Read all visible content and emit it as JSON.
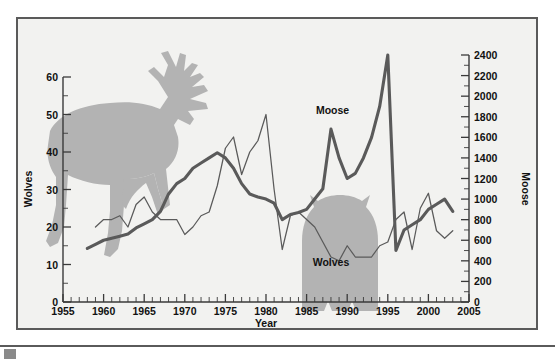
{
  "chart_data": {
    "type": "line",
    "title": "",
    "subtitle": "",
    "xlabel": "Year",
    "ylabel": "Wolves",
    "y2label": "Moose",
    "xlim": [
      1955,
      2005
    ],
    "ylim": [
      0,
      60
    ],
    "y2lim": [
      0,
      2400
    ],
    "grid": false,
    "legend_position": "inline-annotation",
    "x_ticks": [
      1955,
      1960,
      1965,
      1970,
      1975,
      1980,
      1985,
      1990,
      1995,
      2000,
      2005
    ],
    "x_tick_labels": [
      "1955",
      "1960",
      "1965",
      "1970",
      "1975",
      "1980",
      "1985",
      "1990",
      "1995",
      "2000",
      "2005"
    ],
    "x_minor_step": 1,
    "y_ticks": [
      0,
      10,
      20,
      30,
      40,
      50,
      60
    ],
    "y_tick_labels": [
      "0",
      "10",
      "20",
      "30",
      "40",
      "50",
      "60"
    ],
    "y_minor_step": 5,
    "y2_ticks": [
      0,
      200,
      400,
      600,
      800,
      1000,
      1200,
      1400,
      1600,
      1800,
      2000,
      2200,
      2400
    ],
    "y2_tick_labels": [
      "0",
      "200",
      "400",
      "600",
      "800",
      "1000",
      "1200",
      "1400",
      "1600",
      "1800",
      "2000",
      "2200",
      "2400"
    ],
    "y2_minor_step": 100,
    "annotations": [
      {
        "text": "Moose",
        "x": 1988.2,
        "y2": 1830
      },
      {
        "text": "Wolves",
        "x": 1988.0,
        "y": 9.6
      }
    ],
    "series": [
      {
        "name": "Moose",
        "axis": "right",
        "style": "thick-line",
        "color": "#5a5a5a",
        "x": [
          1958,
          1959,
          1960,
          1961,
          1962,
          1963,
          1964,
          1965,
          1966,
          1967,
          1968,
          1969,
          1970,
          1971,
          1972,
          1973,
          1974,
          1975,
          1976,
          1977,
          1978,
          1979,
          1980,
          1981,
          1982,
          1983,
          1984,
          1985,
          1986,
          1987,
          1988,
          1989,
          1990,
          1991,
          1992,
          1993,
          1994,
          1995,
          1996,
          1997,
          1998,
          1999,
          2000,
          2001,
          2002,
          2003
        ],
        "values": [
          520,
          560,
          600,
          620,
          640,
          660,
          720,
          760,
          800,
          880,
          1050,
          1150,
          1200,
          1300,
          1350,
          1400,
          1450,
          1400,
          1300,
          1150,
          1050,
          1020,
          1000,
          960,
          800,
          850,
          870,
          900,
          1000,
          1100,
          1680,
          1400,
          1200,
          1250,
          1400,
          1600,
          1900,
          2400,
          500,
          700,
          750,
          800,
          900,
          950,
          1000,
          880
        ]
      },
      {
        "name": "Wolves",
        "axis": "left",
        "style": "thin-line",
        "color": "#5a5a5a",
        "x": [
          1959,
          1960,
          1961,
          1962,
          1963,
          1964,
          1965,
          1966,
          1967,
          1968,
          1969,
          1970,
          1971,
          1972,
          1973,
          1974,
          1975,
          1976,
          1977,
          1978,
          1979,
          1980,
          1981,
          1982,
          1983,
          1984,
          1985,
          1986,
          1987,
          1988,
          1989,
          1990,
          1991,
          1992,
          1993,
          1994,
          1995,
          1996,
          1997,
          1998,
          1999,
          2000,
          2001,
          2002,
          2003
        ],
        "values": [
          20,
          22,
          22,
          23,
          20,
          26,
          28,
          24,
          22,
          22,
          22,
          18,
          20,
          23,
          24,
          31,
          41,
          44,
          34,
          40,
          43,
          50,
          30,
          14,
          23,
          24,
          22,
          20,
          16,
          12,
          11,
          15,
          12,
          12,
          12,
          15,
          16,
          22,
          24,
          14,
          25,
          29,
          19,
          17,
          19
        ]
      }
    ]
  },
  "axis": {
    "left_title": "Wolves",
    "right_title": "Moose",
    "bottom_title": "Year"
  },
  "labels": {
    "moose": "Moose",
    "wolves": "Wolves"
  },
  "colors": {
    "plot_background": "#f2f2f0",
    "frame": "#5a5a5a",
    "line": "#5a5a5a",
    "silhouette": "#b3b3b3",
    "text": "#111111"
  }
}
